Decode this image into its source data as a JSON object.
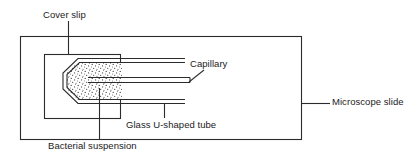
{
  "figure": {
    "type": "labelled-schematic-diagram",
    "background_color": "#ffffff",
    "line_color": "#2b2b2b",
    "stipple_color": "#3a3a3a",
    "labels": {
      "cover_slip": "Cover slip",
      "capillary": "Capillary",
      "microscope_slide": "Microscope slide",
      "glass_u_shaped_tube": "Glass U-shaped tube",
      "bacterial_suspension": "Bacterial suspension"
    },
    "parts": {
      "microscope_slide": "microscope-slide-rectangle",
      "cover_slip": "cover-slip-rectangle",
      "u_tube": "glass-u-shaped-tube-outline",
      "suspension": "bacterial-suspension-stipple-fill",
      "capillary": "capillary-tube-lines"
    }
  }
}
